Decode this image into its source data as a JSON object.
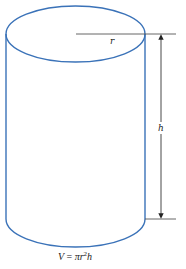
{
  "diagram": {
    "labels": {
      "radius": "r",
      "height": "h"
    },
    "formula": {
      "lhs": "V",
      "equals": "=",
      "pi": "π",
      "r": "r",
      "exp": "2",
      "h": "h"
    },
    "colors": {
      "outline": "#3a72b8",
      "dimension": "#333333"
    }
  }
}
